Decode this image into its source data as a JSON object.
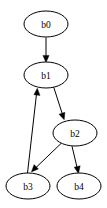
{
  "diagram": {
    "type": "directed-graph",
    "title": "",
    "background_color": "#ffffff",
    "stroke_color": "#000000",
    "node_fill_color": "#ffffff",
    "node_shape": "ellipse",
    "nodes": [
      {
        "id": "b0",
        "label": "b0",
        "cx": 46,
        "cy": 24,
        "rx": 22,
        "ry": 13
      },
      {
        "id": "b1",
        "label": "b1",
        "cx": 46,
        "cy": 75,
        "rx": 22,
        "ry": 13
      },
      {
        "id": "b2",
        "label": "b2",
        "cx": 75,
        "cy": 133,
        "rx": 22,
        "ry": 13
      },
      {
        "id": "b3",
        "label": "b3",
        "cx": 28,
        "cy": 186,
        "rx": 22,
        "ry": 13
      },
      {
        "id": "b4",
        "label": "b4",
        "cx": 79,
        "cy": 186,
        "rx": 22,
        "ry": 13
      }
    ],
    "edges": [
      {
        "id": "e0",
        "from": "b0",
        "to": "b1",
        "label": "",
        "directed": true
      },
      {
        "id": "e1",
        "from": "b1",
        "to": "b2",
        "label": "",
        "directed": true
      },
      {
        "id": "e2",
        "from": "b2",
        "to": "b3",
        "label": "",
        "directed": true
      },
      {
        "id": "e3",
        "from": "b2",
        "to": "b4",
        "label": "",
        "directed": true
      },
      {
        "id": "e4",
        "from": "b3",
        "to": "b1",
        "label": "",
        "directed": true
      }
    ]
  }
}
